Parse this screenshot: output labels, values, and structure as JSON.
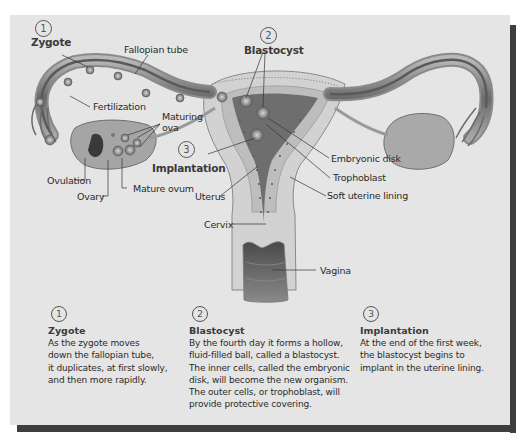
{
  "diagram": {
    "labels": {
      "zygote": {
        "number": "1",
        "text": "Zygote"
      },
      "fallopian_tube": "Fallopian tube",
      "blastocyst": {
        "number": "2",
        "text": "Blastocyst"
      },
      "fertilization": "Fertilization",
      "maturing_ova": [
        "Maturing",
        "ova"
      ],
      "implantation": {
        "number": "3",
        "text": "Implantation"
      },
      "ovulation": "Ovulation",
      "ovary": "Ovary",
      "mature_ovum": "Mature ovum",
      "uterus": "Uterus",
      "embryonic_disk": "Embryonic disk",
      "trophoblast": "Trophoblast",
      "soft_uterine_lining": "Soft uterine lining",
      "cervix": "Cervix",
      "vagina": "Vagina"
    },
    "colors": {
      "panel_bg": "#e5e5e5",
      "shadow": "#3e3e3e",
      "tissue_light": "#cfcfcf",
      "tissue_mid": "#9a9a9a",
      "tissue_dark": "#5a5a5a"
    }
  },
  "captions": [
    {
      "number": "1",
      "title": "Zygote",
      "lines": [
        "As the zygote moves",
        "down the fallopian tube,",
        "it duplicates, at first slowly,",
        "and then more rapidly."
      ]
    },
    {
      "number": "2",
      "title": "Blastocyst",
      "lines": [
        "By the fourth day it forms a hollow,",
        "fluid-filled ball, called a blastocyst.",
        "The inner cells, called the embryonic",
        "disk, will become the new organism.",
        "The outer cells, or trophoblast, will",
        "provide protective covering."
      ]
    },
    {
      "number": "3",
      "title": "Implantation",
      "lines": [
        "At the end of the first week,",
        "the blastocyst begins to",
        "implant in the uterine lining."
      ]
    }
  ]
}
